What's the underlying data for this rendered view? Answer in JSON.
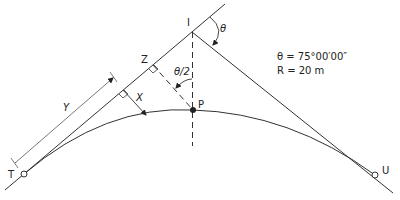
{
  "diagram": {
    "points": {
      "T": "T",
      "U": "U",
      "I": "I",
      "P": "P",
      "Z": "Z"
    },
    "labels": {
      "theta": "θ",
      "half_theta": "θ/2",
      "X": "X",
      "Y": "Y"
    },
    "given": {
      "theta_line": "θ = 75°00′00″",
      "radius_line": "R = 20 m"
    },
    "colors": {
      "line": "#333333",
      "dim_line": "#555555",
      "background": "#ffffff"
    }
  }
}
